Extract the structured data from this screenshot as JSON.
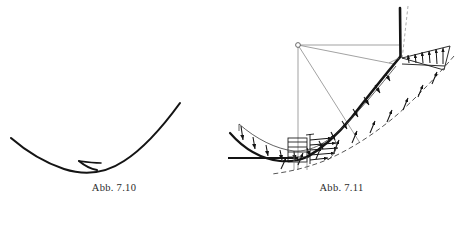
{
  "page": {
    "background_color": "#ffffff",
    "ink_color": "#1a1a1a",
    "thin_ink_color": "#6d6d6d",
    "width": 455,
    "height": 225
  },
  "figures": [
    {
      "id": "abb-7-10",
      "caption": "Abb. 7.10",
      "description": "Two curved blade profiles of a cascade shown without loading arrows",
      "labels": []
    },
    {
      "id": "abb-7-11",
      "caption": "Abb. 7.11",
      "description": "Curved blade with pressure load distribution, radius of curvature and velocity profiles",
      "labels": [
        {
          "key": "radius",
          "text": "R"
        },
        {
          "key": "pressure_difference",
          "text": "-Δp"
        },
        {
          "key": "point_a",
          "text": "A"
        },
        {
          "key": "normal_step",
          "text": "Δn"
        },
        {
          "key": "velocity_max",
          "text": "c",
          "sub": "max"
        },
        {
          "key": "velocity",
          "text": "c"
        },
        {
          "key": "top_marker",
          "text": "0"
        }
      ]
    }
  ],
  "captions": {
    "left": "Abb. 7.10",
    "right": "Abb. 7.11"
  },
  "labels_711": {
    "radius": "R",
    "pressure_difference": "-Δp",
    "point_a": "A",
    "normal_step": "Δn",
    "velocity_max_base": "c",
    "velocity_max_sub": "max",
    "velocity": "c",
    "top_marker": "0"
  }
}
